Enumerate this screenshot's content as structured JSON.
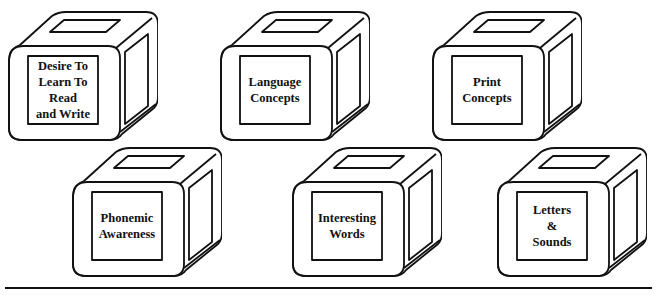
{
  "diagram": {
    "type": "concept-blocks",
    "line_color": "#111111",
    "background": "#ffffff",
    "blocks": [
      {
        "label": "Desire To\nLearn To\nRead\nand Write",
        "x": 6,
        "y": 10
      },
      {
        "label": "Language\nConcepts",
        "x": 218,
        "y": 10
      },
      {
        "label": "Print\nConcepts",
        "x": 430,
        "y": 10
      },
      {
        "label": "Phonemic\nAwareness",
        "x": 70,
        "y": 146
      },
      {
        "label": "Interesting\nWords",
        "x": 290,
        "y": 146
      },
      {
        "label": "Letters\n&\nSounds",
        "x": 495,
        "y": 146
      }
    ]
  }
}
